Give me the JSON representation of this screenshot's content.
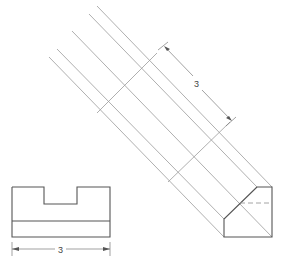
{
  "figure": {
    "type": "orthographic-auxiliary-projection",
    "front_view": {
      "label": "front-view",
      "width_dimension": "3"
    },
    "auxiliary_view": {
      "label": "auxiliary-end-view",
      "depth_dimension": "3"
    },
    "colors": {
      "object_line": "#555555",
      "projection_line": "#9a9a9a",
      "hidden_line": "#9a9a9a",
      "background": "#ffffff"
    }
  }
}
